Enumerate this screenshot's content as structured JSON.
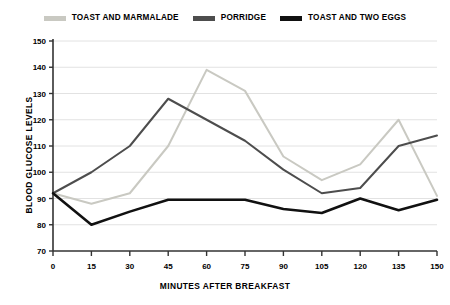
{
  "chart_data": {
    "type": "line",
    "title": "",
    "xlabel": "MINUTES AFTER BREAKFAST",
    "ylabel": "BLOOD GLUCOSE LEVELS",
    "x": [
      0,
      15,
      30,
      45,
      60,
      75,
      90,
      105,
      120,
      135,
      150
    ],
    "xtick_labels": [
      "0",
      "15",
      "30",
      "45",
      "60",
      "75",
      "90",
      "105",
      "120",
      "135",
      "150"
    ],
    "xlim": [
      0,
      150
    ],
    "ylim": [
      70,
      150
    ],
    "ytick_labels": [
      "70",
      "80",
      "90",
      "100",
      "110",
      "120",
      "130",
      "140",
      "150"
    ],
    "yticks": [
      70,
      80,
      90,
      100,
      110,
      120,
      130,
      140,
      150
    ],
    "grid": "horizontal",
    "legend_position": "top-center",
    "series": [
      {
        "name": "TOAST AND MARMALADE",
        "color": "#c9c9c2",
        "values": [
          92,
          88,
          92,
          110,
          139,
          131,
          106,
          97,
          103,
          120,
          91
        ]
      },
      {
        "name": "PORRIDGE",
        "color": "#4d4d4d",
        "values": [
          92,
          100,
          110,
          128,
          120,
          112,
          101,
          92,
          94,
          110,
          114
        ]
      },
      {
        "name": "TOAST AND TWO EGGS",
        "color": "#111111",
        "values": [
          92,
          80,
          85,
          89.5,
          89.5,
          89.5,
          86,
          84.5,
          90,
          85.5,
          89.5
        ]
      }
    ]
  },
  "legend": {
    "items": [
      {
        "label": "TOAST AND MARMALADE",
        "color": "#c9c9c2"
      },
      {
        "label": "PORRIDGE",
        "color": "#4d4d4d"
      },
      {
        "label": "TOAST AND TWO EGGS",
        "color": "#111111"
      }
    ]
  },
  "axes": {
    "y_title": "BLOOD GLUCOSE LEVELS",
    "x_title": "MINUTES AFTER BREAKFAST"
  }
}
